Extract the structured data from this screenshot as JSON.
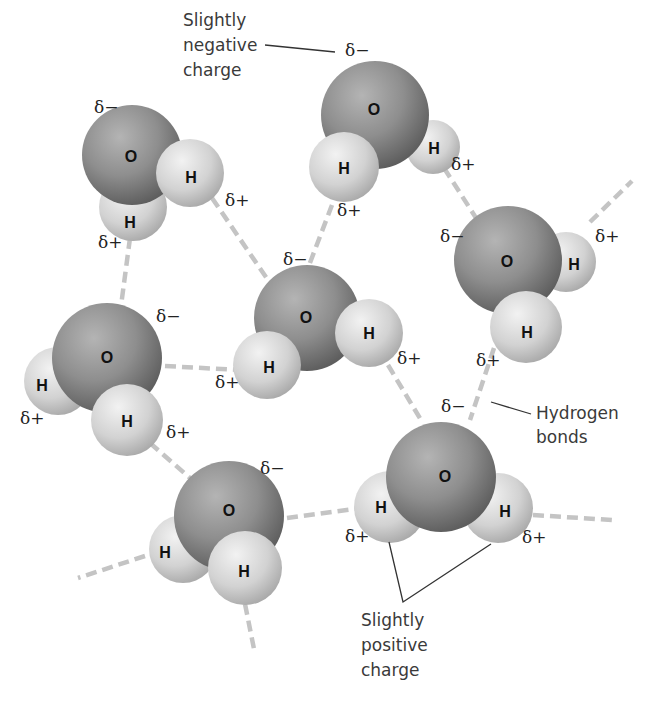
{
  "diagram": {
    "colors": {
      "oxygen": "#8a8a8a",
      "hydrogen": "#d8d8d8",
      "hydrogen_bond": "#c4c4c4",
      "text": "#3a3a3a"
    },
    "labels": {
      "negative": [
        "Slightly",
        "negative",
        "charge"
      ],
      "hbonds": [
        "Hydrogen",
        "bonds"
      ],
      "positive": [
        "Slightly",
        "positive",
        "charge"
      ]
    },
    "symbols": {
      "delta_minus": "δ−",
      "delta_plus": "δ+",
      "oxygen": "O",
      "hydrogen": "H"
    },
    "molecules": [
      {
        "id": "top-left",
        "O": "O",
        "H1": "H",
        "H2": "H",
        "charge_O": "δ−",
        "charge_H1": "δ+",
        "charge_H2": "δ+"
      },
      {
        "id": "top-center",
        "O": "O",
        "H1": "H",
        "H2": "H",
        "charge_O": "δ−",
        "charge_H1": "δ+",
        "charge_H2": "δ+"
      },
      {
        "id": "right",
        "O": "O",
        "H1": "H",
        "H2": "H",
        "charge_O": "δ−",
        "charge_H1": "δ+",
        "charge_H2": "δ+"
      },
      {
        "id": "center",
        "O": "O",
        "H1": "H",
        "H2": "H",
        "charge_O": "δ−",
        "charge_H1": "δ+",
        "charge_H2": "δ+"
      },
      {
        "id": "left",
        "O": "O",
        "H1": "H",
        "H2": "H",
        "charge_O": "δ−",
        "charge_H1": "δ+",
        "charge_H2": "δ+"
      },
      {
        "id": "bottom-left",
        "O": "O",
        "H1": "H",
        "H2": "H",
        "charge_O": "δ−"
      },
      {
        "id": "bottom-right",
        "O": "O",
        "H1": "H",
        "H2": "H",
        "charge_O": "δ−",
        "charge_H1": "δ+",
        "charge_H2": "δ+"
      }
    ]
  }
}
